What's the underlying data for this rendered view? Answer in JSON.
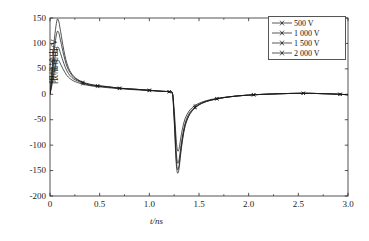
{
  "chart_data": {
    "type": "line",
    "title": "",
    "xlabel": "t/ns",
    "ylabel": "限幅输出/V",
    "xlim": [
      0,
      3.0
    ],
    "ylim": [
      -200,
      150
    ],
    "xticks": [
      "0",
      "0.5",
      "1.0",
      "1.5",
      "2.0",
      "2.5",
      "3.0"
    ],
    "xtick_values": [
      0,
      0.5,
      1.0,
      1.5,
      2.0,
      2.5,
      3.0
    ],
    "yticks": [
      "150",
      "100",
      "50",
      "0",
      "-50",
      "-100",
      "-150",
      "-200"
    ],
    "ytick_values": [
      150,
      100,
      50,
      0,
      -50,
      -100,
      -150,
      -200
    ],
    "grid": false,
    "legend_position": "top-right",
    "series": [
      {
        "name": "500 V",
        "color": "#1a1a1a",
        "marker": "cross",
        "x": [
          0.0,
          0.02,
          0.04,
          0.06,
          0.075,
          0.09,
          0.1,
          0.115,
          0.13,
          0.15,
          0.17,
          0.2,
          0.24,
          0.28,
          0.33,
          0.4,
          0.48,
          0.58,
          0.7,
          0.85,
          1.0,
          1.12,
          1.2,
          1.232,
          1.245,
          1.258,
          1.268,
          1.278,
          1.288,
          1.3,
          1.315,
          1.335,
          1.36,
          1.4,
          1.46,
          1.55,
          1.68,
          1.85,
          2.05,
          2.3,
          2.55,
          2.78,
          2.92,
          3.0
        ],
        "y": [
          0,
          18,
          42,
          62,
          68,
          66,
          62,
          56,
          50,
          43,
          37,
          31,
          26,
          23,
          20,
          17,
          15,
          13,
          11,
          9,
          7,
          6,
          5,
          2,
          -18,
          -52,
          -82,
          -104,
          -112,
          -106,
          -88,
          -66,
          -48,
          -33,
          -22,
          -14,
          -8,
          -4,
          -1,
          1,
          2,
          1,
          0,
          -1
        ]
      },
      {
        "name": "1 000 V",
        "color": "#1a1a1a",
        "marker": "cross",
        "x": [
          0.0,
          0.02,
          0.04,
          0.06,
          0.075,
          0.09,
          0.1,
          0.115,
          0.13,
          0.15,
          0.17,
          0.2,
          0.24,
          0.28,
          0.33,
          0.4,
          0.48,
          0.58,
          0.7,
          0.85,
          1.0,
          1.12,
          1.2,
          1.232,
          1.245,
          1.258,
          1.268,
          1.278,
          1.288,
          1.3,
          1.315,
          1.335,
          1.36,
          1.4,
          1.46,
          1.55,
          1.68,
          1.85,
          2.05,
          2.3,
          2.55,
          2.78,
          2.92,
          3.0
        ],
        "y": [
          0,
          26,
          58,
          84,
          93,
          90,
          84,
          75,
          66,
          55,
          46,
          37,
          30,
          26,
          22,
          18,
          16,
          14,
          12,
          10,
          8,
          6,
          5,
          2,
          -24,
          -66,
          -104,
          -128,
          -136,
          -128,
          -106,
          -80,
          -57,
          -38,
          -25,
          -15,
          -9,
          -4,
          -1,
          1,
          2,
          1,
          0,
          -1
        ]
      },
      {
        "name": "1 500 V",
        "color": "#1a1a1a",
        "marker": "cross",
        "x": [
          0.0,
          0.02,
          0.04,
          0.06,
          0.075,
          0.09,
          0.1,
          0.115,
          0.13,
          0.15,
          0.17,
          0.2,
          0.24,
          0.28,
          0.33,
          0.4,
          0.48,
          0.58,
          0.7,
          0.85,
          1.0,
          1.12,
          1.2,
          1.232,
          1.245,
          1.258,
          1.268,
          1.278,
          1.288,
          1.3,
          1.315,
          1.335,
          1.36,
          1.4,
          1.46,
          1.55,
          1.68,
          1.85,
          2.05,
          2.3,
          2.55,
          2.78,
          2.92,
          3.0
        ],
        "y": [
          0,
          36,
          80,
          112,
          124,
          120,
          111,
          98,
          84,
          68,
          55,
          43,
          33,
          28,
          23,
          19,
          17,
          15,
          12,
          10,
          8,
          6,
          5,
          2,
          -28,
          -76,
          -118,
          -142,
          -148,
          -139,
          -114,
          -86,
          -61,
          -41,
          -26,
          -16,
          -9,
          -4,
          -1,
          1,
          2,
          1,
          0,
          -1
        ]
      },
      {
        "name": "2 000 V",
        "color": "#1a1a1a",
        "marker": "cross",
        "x": [
          0.0,
          0.02,
          0.04,
          0.06,
          0.075,
          0.09,
          0.1,
          0.115,
          0.13,
          0.15,
          0.17,
          0.2,
          0.24,
          0.28,
          0.33,
          0.4,
          0.48,
          0.58,
          0.7,
          0.85,
          1.0,
          1.12,
          1.2,
          1.232,
          1.245,
          1.258,
          1.268,
          1.278,
          1.288,
          1.3,
          1.315,
          1.335,
          1.36,
          1.4,
          1.46,
          1.55,
          1.68,
          1.85,
          2.05,
          2.3,
          2.55,
          2.78,
          2.92,
          3.0
        ],
        "y": [
          0,
          46,
          100,
          134,
          148,
          142,
          131,
          114,
          96,
          76,
          61,
          46,
          35,
          29,
          24,
          20,
          17,
          15,
          12,
          10,
          8,
          6,
          5,
          2,
          -32,
          -84,
          -128,
          -150,
          -155,
          -145,
          -119,
          -89,
          -63,
          -42,
          -27,
          -16,
          -9,
          -4,
          -1,
          1,
          2,
          1,
          0,
          -1
        ]
      }
    ]
  },
  "legend": {
    "items": [
      {
        "label": "500 V"
      },
      {
        "label": "1 000 V"
      },
      {
        "label": "1 500 V"
      },
      {
        "label": "2 000 V"
      }
    ]
  }
}
